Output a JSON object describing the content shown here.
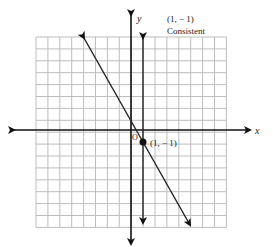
{
  "chart_data": {
    "type": "line",
    "title": "",
    "xlabel": "x",
    "ylabel": "y",
    "origin_label": "O",
    "xlim": [
      -8,
      8
    ],
    "ylim": [
      -8,
      8
    ],
    "grid": true,
    "series": [
      {
        "name": "x = 1",
        "equation": "x = 1",
        "points": [
          [
            1,
            7.5
          ],
          [
            1,
            -7.5
          ]
        ]
      },
      {
        "name": "y = -2x + 1",
        "equation": "y = -2x + 1",
        "points": [
          [
            -4,
            9
          ],
          [
            5,
            -9
          ]
        ]
      }
    ],
    "intersection": {
      "x": 1,
      "y": -1,
      "label": "(1, − 1)"
    },
    "annotations": [
      {
        "text": "(1, − 1)",
        "role": "solution"
      },
      {
        "text": "Consistent",
        "role": "classification"
      }
    ]
  },
  "labels": {
    "x_axis": "x",
    "y_axis": "y",
    "origin": "O",
    "point": "(1, − 1)",
    "solution": "(1, − 1)",
    "classification": "Consistent"
  },
  "colors": {
    "grid": "#bdbdbd",
    "axis": "#111111",
    "line": "#222222"
  }
}
